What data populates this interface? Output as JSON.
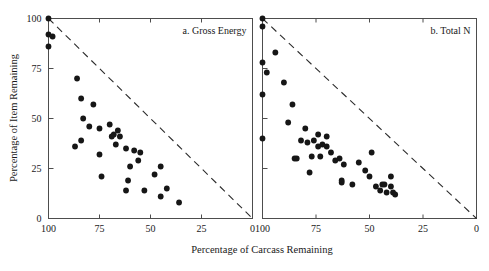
{
  "figure": {
    "width": 489,
    "height": 271,
    "background": "#ffffff",
    "point_color": "#161616",
    "axis_color": "#4d4d4d",
    "refline_color": "#2b2b2b",
    "shared_xlabel": "Percentage of Carcass Remaining",
    "shared_ylabel": "Percentage of Item Remaining"
  },
  "chart_data": [
    {
      "type": "scatter",
      "title": "a. Gross Energy",
      "xlabel": "Percentage of Carcass Remaining",
      "ylabel": "Percentage of Item Remaining",
      "xlim": [
        100,
        0
      ],
      "ylim": [
        0,
        100
      ],
      "x_reversed": true,
      "grid": false,
      "legend": "none",
      "xticks": [
        100,
        75,
        50,
        25,
        0
      ],
      "yticks": [
        0,
        25,
        50,
        75,
        100
      ],
      "xticklabels": [
        "100",
        "75",
        "50",
        "25",
        "0"
      ],
      "yticklabels": [
        "0",
        "25",
        "50",
        "75",
        "100"
      ],
      "annotations": [
        {
          "text": "a. Gross Energy",
          "position": "top-right"
        }
      ],
      "reference_line": {
        "style": "dashed",
        "from": [
          100,
          100
        ],
        "to": [
          0,
          0
        ],
        "label": "1:1 line"
      },
      "series": [
        {
          "name": "Gross Energy Remaining",
          "marker": "filled-circle",
          "points": [
            [
              100,
              100
            ],
            [
              100,
              92
            ],
            [
              98,
              91
            ],
            [
              100,
              86
            ],
            [
              86,
              70
            ],
            [
              84,
              60
            ],
            [
              78,
              57
            ],
            [
              83,
              50
            ],
            [
              80,
              46
            ],
            [
              75,
              45
            ],
            [
              84,
              39
            ],
            [
              87,
              36
            ],
            [
              75,
              32
            ],
            [
              74,
              21
            ],
            [
              70,
              47
            ],
            [
              68,
              42
            ],
            [
              69,
              41
            ],
            [
              66,
              44
            ],
            [
              65,
              41
            ],
            [
              67,
              37
            ],
            [
              62,
              35
            ],
            [
              60,
              26
            ],
            [
              61,
              19
            ],
            [
              62,
              14
            ],
            [
              58,
              34
            ],
            [
              56,
              29
            ],
            [
              55,
              33
            ],
            [
              53,
              14
            ],
            [
              48,
              22
            ],
            [
              45,
              26
            ],
            [
              45,
              11
            ],
            [
              42,
              15
            ],
            [
              36,
              8
            ]
          ]
        }
      ]
    },
    {
      "type": "scatter",
      "title": "b. Total N",
      "xlabel": "Percentage of Carcass Remaining",
      "ylabel": "Percentage of Item Remaining",
      "xlim": [
        100,
        0
      ],
      "ylim": [
        0,
        100
      ],
      "x_reversed": true,
      "grid": false,
      "legend": "none",
      "xticks": [
        100,
        75,
        50,
        25,
        0
      ],
      "yticks": [
        0,
        25,
        50,
        75,
        100
      ],
      "xticklabels": [
        "100",
        "75",
        "50",
        "25",
        "0"
      ],
      "yticklabels": [
        "0",
        "25",
        "50",
        "75",
        "100"
      ],
      "annotations": [
        {
          "text": "b. Total N",
          "position": "top-right"
        }
      ],
      "reference_line": {
        "style": "dashed",
        "from": [
          100,
          100
        ],
        "to": [
          0,
          0
        ],
        "label": "1:1 line"
      },
      "series": [
        {
          "name": "Total N Remaining",
          "marker": "filled-circle",
          "points": [
            [
              100,
              100
            ],
            [
              100,
              96
            ],
            [
              100,
              78
            ],
            [
              98,
              73
            ],
            [
              100,
              62
            ],
            [
              100,
              40
            ],
            [
              94,
              83
            ],
            [
              90,
              68
            ],
            [
              86,
              57
            ],
            [
              88,
              48
            ],
            [
              80,
              45
            ],
            [
              74,
              42
            ],
            [
              70,
              41
            ],
            [
              82,
              39
            ],
            [
              79,
              38
            ],
            [
              85,
              30
            ],
            [
              84,
              30
            ],
            [
              76,
              39
            ],
            [
              72,
              37
            ],
            [
              74,
              36
            ],
            [
              70,
              36
            ],
            [
              77,
              31
            ],
            [
              73,
              31
            ],
            [
              68,
              33
            ],
            [
              66,
              29
            ],
            [
              78,
              23
            ],
            [
              64,
              30
            ],
            [
              62,
              27
            ],
            [
              63,
              19
            ],
            [
              63,
              18
            ],
            [
              58,
              17
            ],
            [
              55,
              28
            ],
            [
              52,
              24
            ],
            [
              49,
              33
            ],
            [
              50,
              21
            ],
            [
              47,
              16
            ],
            [
              45,
              14
            ],
            [
              44,
              17
            ],
            [
              43,
              17
            ],
            [
              42,
              13
            ],
            [
              40,
              21
            ],
            [
              40,
              16
            ],
            [
              39,
              13
            ],
            [
              38,
              12
            ]
          ]
        }
      ]
    }
  ]
}
